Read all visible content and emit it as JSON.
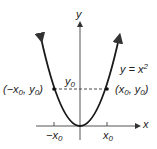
{
  "figure": {
    "header_fragment": "...g.",
    "curve_label": {
      "lhs": "y = x",
      "exp": "2"
    },
    "axes": {
      "x_label": "x",
      "y_label": "y"
    },
    "y_tick": {
      "var": "y",
      "sub": "0"
    },
    "x_ticks": [
      {
        "var": "−x",
        "sub": "0"
      },
      {
        "var": "x",
        "sub": "0"
      }
    ],
    "points": [
      {
        "label_open": "(−x",
        "sub1": "0",
        "mid": ", y",
        "sub2": "0",
        "close": ")"
      },
      {
        "label_open": "(x",
        "sub1": "0",
        "mid": ", y",
        "sub2": "0",
        "close": ")"
      }
    ],
    "colors": {
      "ink": "#1a1a1a",
      "axis": "#444444"
    }
  }
}
